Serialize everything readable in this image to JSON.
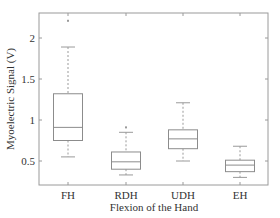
{
  "chart_data": {
    "type": "box",
    "title": "",
    "xlabel": "Flexion of the Hand",
    "ylabel": "Myoelectric Signal (V)",
    "ylim": [
      0.21,
      2.3
    ],
    "yticks": [
      0.5,
      1,
      1.5,
      2
    ],
    "ytick_labels": [
      "0.5",
      "1",
      "1.5",
      "2"
    ],
    "categories": [
      "FH",
      "RDH",
      "UDH",
      "EH"
    ],
    "grid": false,
    "legend": null,
    "boxes": [
      {
        "label": "FH",
        "whisker_low": 0.55,
        "q1": 0.75,
        "median": 0.91,
        "q3": 1.32,
        "whisker_high": 1.89,
        "outliers": [
          2.21
        ]
      },
      {
        "label": "RDH",
        "whisker_low": 0.33,
        "q1": 0.4,
        "median": 0.49,
        "q3": 0.61,
        "whisker_high": 0.85,
        "outliers": [
          0.91
        ]
      },
      {
        "label": "UDH",
        "whisker_low": 0.5,
        "q1": 0.65,
        "median": 0.77,
        "q3": 0.88,
        "whisker_high": 1.21,
        "outliers": []
      },
      {
        "label": "EH",
        "whisker_low": 0.3,
        "q1": 0.37,
        "median": 0.45,
        "q3": 0.51,
        "whisker_high": 0.68,
        "outliers": []
      }
    ],
    "colors": {
      "axis": "#9a9a9a",
      "box": "#8c8c8c",
      "whisker": "#9a9a9a",
      "text": "#333333"
    }
  }
}
